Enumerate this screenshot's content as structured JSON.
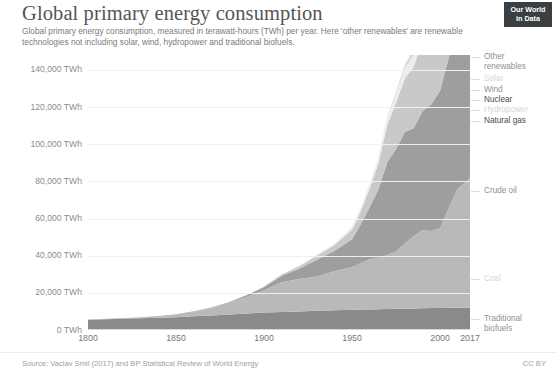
{
  "header": {
    "title": "Global primary energy consumption",
    "subtitle": "Global primary energy consumption, measured in terawatt-hours (TWh) per year. Here 'other renewables' are renewable technologies not including solar, wind, hydropower and traditional biofuels.",
    "logo_line1": "Our World",
    "logo_line2": "in Data"
  },
  "footer": {
    "source": "Source: Vaclav Smil (2017) and BP Statistical Review of World Energy",
    "license": "CC BY"
  },
  "colors": {
    "traditional_biofuels": "#8a8a8a",
    "coal": "#b9b9b9",
    "crude_oil": "#9e9e9e",
    "natural_gas": "#c9c9c9",
    "hydropower": "#ededed",
    "nuclear": "#dcdcdc",
    "wind": "#f2f2f2",
    "solar": "#fafafa",
    "other_renewables": "#e4e4e4",
    "grid": "#f0f0f0",
    "text": "#8c8c8c",
    "logo_bg": "#3a3f42"
  },
  "chart_data": {
    "type": "area",
    "stacked": true,
    "title": "Global primary energy consumption",
    "subtitle": "Global primary energy consumption, measured in terawatt-hours (TWh) per year. Here 'other renewables' are renewable technologies not including solar, wind, hydropower and traditional biofuels.",
    "xlabel": "",
    "ylabel": "TWh",
    "xlim": [
      1800,
      2017
    ],
    "ylim": [
      0,
      148000
    ],
    "grid": true,
    "legend_position": "right-inline",
    "ytick_values": [
      0,
      20000,
      40000,
      60000,
      80000,
      100000,
      120000,
      140000
    ],
    "ytick_labels": [
      "0 TWh",
      "20,000 TWh",
      "40,000 TWh",
      "60,000 TWh",
      "80,000 TWh",
      "100,000 TWh",
      "120,000 TWh",
      "140,000 TWh"
    ],
    "xtick_values": [
      1800,
      1850,
      1900,
      1950,
      2000,
      2017
    ],
    "xtick_labels": [
      "1800",
      "1850",
      "1900",
      "1950",
      "2000",
      "2017"
    ],
    "x": [
      1800,
      1810,
      1820,
      1830,
      1840,
      1850,
      1860,
      1870,
      1880,
      1890,
      1900,
      1910,
      1920,
      1930,
      1940,
      1950,
      1955,
      1960,
      1965,
      1970,
      1975,
      1980,
      1985,
      1990,
      1995,
      2000,
      2005,
      2010,
      2015,
      2017
    ],
    "series": [
      {
        "name": "Traditional biofuels",
        "color": "#8a8a8a",
        "label": "Traditional\nbiofuels",
        "label_color": "#8f8f8f",
        "values": [
          5556,
          5816,
          6076,
          6336,
          6596,
          6856,
          7361,
          7867,
          8372,
          8878,
          9383,
          9700,
          10000,
          10300,
          10600,
          10900,
          11000,
          11100,
          11200,
          11300,
          11400,
          11500,
          11600,
          11700,
          11800,
          11900,
          11950,
          11970,
          11980,
          11980
        ]
      },
      {
        "name": "Coal",
        "color": "#b9b9b9",
        "label": "Coal",
        "label_color": "#b3b3b3",
        "values": [
          97,
          190,
          350,
          580,
          970,
          1641,
          2700,
          4100,
          6200,
          8900,
          12000,
          16000,
          17500,
          18500,
          21000,
          23000,
          25000,
          27000,
          27500,
          29000,
          31000,
          35000,
          39000,
          42000,
          41500,
          43000,
          54000,
          64000,
          68000,
          70000
        ]
      },
      {
        "name": "Crude oil",
        "color": "#9e9e9e",
        "label": "Crude oil",
        "label_color": "#8f8f8f",
        "values": [
          0,
          0,
          0,
          0,
          0,
          0,
          20,
          120,
          350,
          900,
          1700,
          3500,
          5500,
          9000,
          11000,
          15000,
          21000,
          28000,
          37000,
          50000,
          55000,
          60000,
          58000,
          64000,
          68000,
          74000,
          81000,
          85000,
          90000,
          93000
        ]
      },
      {
        "name": "Natural gas",
        "color": "#c9c9c9",
        "label": "Natural gas",
        "label_color": "#4a4a4a",
        "values": [
          0,
          0,
          0,
          0,
          0,
          0,
          0,
          10,
          40,
          120,
          300,
          700,
          1300,
          2200,
          3100,
          5000,
          7000,
          10000,
          14000,
          20000,
          25000,
          29000,
          33000,
          38000,
          41000,
          45000,
          51000,
          56000,
          62000,
          65000
        ]
      },
      {
        "name": "Hydropower",
        "color": "#ededed",
        "label": "Hydropower",
        "label_color": "#d6d6d6",
        "values": [
          0,
          0,
          0,
          0,
          0,
          0,
          0,
          0,
          10,
          40,
          100,
          250,
          400,
          700,
          900,
          1500,
          2000,
          2500,
          3100,
          3900,
          4600,
          5200,
          6000,
          6600,
          7000,
          7400,
          7900,
          9000,
          9800,
          10100
        ]
      },
      {
        "name": "Nuclear",
        "color": "#dcdcdc",
        "label": "Nuclear",
        "label_color": "#2f2f2f",
        "values": [
          0,
          0,
          0,
          0,
          0,
          0,
          0,
          0,
          0,
          0,
          0,
          0,
          0,
          0,
          0,
          0,
          10,
          60,
          200,
          600,
          1300,
          2000,
          3800,
          5500,
          6500,
          7200,
          7600,
          7300,
          6700,
          6800
        ]
      },
      {
        "name": "Wind",
        "color": "#f2f2f2",
        "label": "Wind",
        "label_color": "#b0b0b0",
        "values": [
          0,
          0,
          0,
          0,
          0,
          0,
          0,
          0,
          0,
          0,
          0,
          0,
          0,
          0,
          0,
          0,
          0,
          0,
          0,
          0,
          0,
          0,
          10,
          40,
          100,
          250,
          600,
          1600,
          3200,
          3900
        ]
      },
      {
        "name": "Solar",
        "color": "#fafafa",
        "label": "Solar",
        "label_color": "#e0e0e0",
        "values": [
          0,
          0,
          0,
          0,
          0,
          0,
          0,
          0,
          0,
          0,
          0,
          0,
          0,
          0,
          0,
          0,
          0,
          0,
          0,
          0,
          0,
          0,
          0,
          2,
          5,
          10,
          40,
          200,
          1100,
          1600
        ]
      },
      {
        "name": "Other renewables",
        "color": "#e4e4e4",
        "label": "Other\nrenewables",
        "label_color": "#8f8f8f",
        "values": [
          0,
          0,
          0,
          0,
          0,
          0,
          0,
          0,
          0,
          0,
          0,
          0,
          0,
          0,
          0,
          0,
          0,
          0,
          0,
          20,
          60,
          130,
          300,
          500,
          700,
          900,
          1200,
          1700,
          2300,
          2600
        ]
      }
    ],
    "total_2017": 156000
  },
  "legend": {
    "items": [
      {
        "label": "Other\nrenewables",
        "tone": "normal",
        "top": 52
      },
      {
        "label": "Solar",
        "tone": "faint",
        "top": 74
      },
      {
        "label": "Wind",
        "tone": "normal",
        "top": 85
      },
      {
        "label": "Nuclear",
        "tone": "dark",
        "top": 95
      },
      {
        "label": "Hydropower",
        "tone": "faint",
        "top": 105
      },
      {
        "label": "Natural gas",
        "tone": "dark",
        "top": 116
      },
      {
        "label": "Crude oil",
        "tone": "normal",
        "top": 186
      },
      {
        "label": "Coal",
        "tone": "faint",
        "top": 274
      },
      {
        "label": "Traditional\nbiofuels",
        "tone": "normal",
        "top": 314
      }
    ]
  }
}
